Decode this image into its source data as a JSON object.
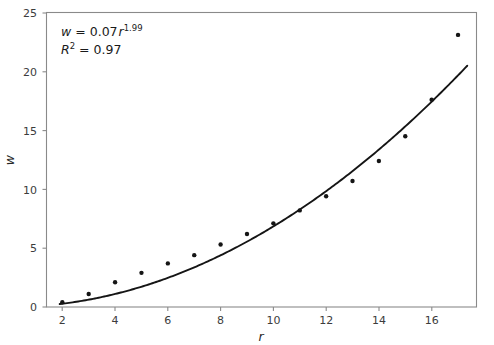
{
  "chart_data": {
    "type": "scatter",
    "title": "",
    "xlabel": "r",
    "ylabel": "w",
    "xlim": [
      1.4,
      17.7
    ],
    "ylim": [
      0,
      25
    ],
    "grid": false,
    "legend": null,
    "x": [
      2,
      3,
      4,
      5,
      6,
      7,
      8,
      9,
      10,
      11,
      12,
      13,
      14,
      15,
      16,
      17
    ],
    "values": [
      0.4,
      1.1,
      2.1,
      2.9,
      3.7,
      4.4,
      5.3,
      6.2,
      7.1,
      8.2,
      9.4,
      10.7,
      12.4,
      14.5,
      17.6,
      23.1
    ],
    "series": [
      {
        "name": "observations",
        "type": "scatter",
        "marker": "circle",
        "color": "#151515",
        "x": [
          2,
          3,
          4,
          5,
          6,
          7,
          8,
          9,
          10,
          11,
          12,
          13,
          14,
          15,
          16,
          17
        ],
        "values": [
          0.4,
          1.1,
          2.1,
          2.9,
          3.7,
          4.4,
          5.3,
          6.2,
          7.1,
          8.2,
          9.4,
          10.7,
          12.4,
          14.5,
          17.6,
          23.1
        ]
      },
      {
        "name": "power-law fit",
        "type": "line",
        "color": "#151515",
        "equation": "w = 0.07 * r^1.99",
        "coefficient": 0.07,
        "exponent": 1.99,
        "x_range": [
          1.9,
          17.35
        ]
      }
    ],
    "xticks": [
      2,
      4,
      6,
      8,
      10,
      12,
      14,
      16
    ],
    "xticklabels": [
      "2",
      "4",
      "6",
      "8",
      "10",
      "12",
      "14",
      "16"
    ],
    "yticks": [
      0,
      5,
      10,
      15,
      20,
      25
    ],
    "yticklabels": [
      "0",
      "5",
      "10",
      "15",
      "20",
      "25"
    ],
    "annotations": {
      "equation": {
        "lhs": "w",
        "eq": "=",
        "coefficient": "0.07",
        "base": "r",
        "exponent": "1.99"
      },
      "goodness_of_fit": {
        "lhs": "R",
        "lhs_exponent": "2",
        "eq": "=",
        "value": "0.97"
      }
    },
    "colors": {
      "marker": "#151515",
      "line": "#151515",
      "axis": "#8a8a8a",
      "text": "#3c3c3c",
      "background": "#ffffff"
    }
  }
}
